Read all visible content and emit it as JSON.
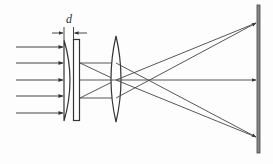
{
  "diagram": {
    "type": "optics-ray-diagram",
    "labels": {
      "gap": "d"
    },
    "colors": {
      "stroke": "#3a3a3a",
      "ray": "#444444",
      "screen": "#555555",
      "background": "#fdfdfd"
    },
    "elements": [
      {
        "id": "incident-rays",
        "description": "5 parallel horizontal arrows entering from left"
      },
      {
        "id": "plano-convex-element",
        "description": "wedge/plano-convex element with flat left face"
      },
      {
        "id": "glass-plate",
        "description": "thin rectangular plate"
      },
      {
        "id": "gap-dimension",
        "description": "dimension d between element and plate"
      },
      {
        "id": "biconvex-lens",
        "description": "converging lens"
      },
      {
        "id": "screen",
        "description": "vertical screen on right"
      }
    ],
    "incident_ray_y": [
      47,
      63,
      80,
      96,
      113
    ],
    "screen_hit_y": [
      23,
      80,
      137
    ]
  }
}
